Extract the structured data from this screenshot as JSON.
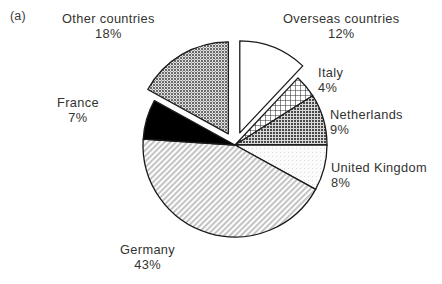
{
  "figure": {
    "panel_label": "(a)",
    "background_color": "#ffffff"
  },
  "chart_data": {
    "type": "pie",
    "title": "",
    "xlabel": "",
    "ylabel": "",
    "legend_position": "none",
    "grid": false,
    "units": "percent",
    "start_angle_deg": 0,
    "direction": "clockwise",
    "categories": [
      "Overseas countries",
      "Italy",
      "Netherlands",
      "United Kingdom",
      "Germany",
      "France",
      "Other countries"
    ],
    "values": [
      12,
      4,
      9,
      8,
      43,
      7,
      18
    ],
    "slices": [
      {
        "name": "Overseas countries",
        "label": "Overseas countries",
        "value": 12,
        "pct_text": "12%",
        "fill_style": "white",
        "fill_color": "#ffffff",
        "stroke_color": "#1a1a1a",
        "exploded": true,
        "start_deg": 0,
        "end_deg": 43.2
      },
      {
        "name": "Italy",
        "label": "Italy",
        "value": 4,
        "pct_text": "4%",
        "fill_style": "crosshatch",
        "fill_color": "#3a3a3a",
        "stroke_color": "#1a1a1a",
        "exploded": false,
        "start_deg": 43.2,
        "end_deg": 57.6
      },
      {
        "name": "Netherlands",
        "label": "Netherlands",
        "value": 9,
        "pct_text": "9%",
        "fill_style": "dark-stipple",
        "fill_color": "#6f6f6f",
        "stroke_color": "#1a1a1a",
        "exploded": false,
        "start_deg": 57.6,
        "end_deg": 90.0
      },
      {
        "name": "United Kingdom",
        "label": "United Kingdom",
        "value": 8,
        "pct_text": "8%",
        "fill_style": "very-light",
        "fill_color": "#efefef",
        "stroke_color": "#1a1a1a",
        "exploded": false,
        "start_deg": 90.0,
        "end_deg": 118.8
      },
      {
        "name": "Germany",
        "label": "Germany",
        "value": 43,
        "pct_text": "43%",
        "fill_style": "light-diagonal-hatch",
        "fill_color": "#c9c9c9",
        "stroke_color": "#1a1a1a",
        "exploded": false,
        "start_deg": 118.8,
        "end_deg": 273.6
      },
      {
        "name": "France",
        "label": "France",
        "value": 7,
        "pct_text": "7%",
        "fill_style": "solid-black",
        "fill_color": "#000000",
        "stroke_color": "#1a1a1a",
        "exploded": false,
        "start_deg": 273.6,
        "end_deg": 298.8
      },
      {
        "name": "Other countries",
        "label": "Other countries",
        "value": 18,
        "pct_text": "18%",
        "fill_style": "medium-stipple",
        "fill_color": "#8a8a8a",
        "stroke_color": "#1a1a1a",
        "exploded": true,
        "start_deg": 298.8,
        "end_deg": 360.0
      }
    ]
  },
  "labels": {
    "other_countries": {
      "name": "Other countries",
      "pct": "18%"
    },
    "overseas_countries": {
      "name": "Overseas countries",
      "pct": "12%"
    },
    "italy": {
      "name": "Italy",
      "pct": "4%"
    },
    "netherlands": {
      "name": "Netherlands",
      "pct": "9%"
    },
    "united_kingdom": {
      "name": "United Kingdom",
      "pct": "8%"
    },
    "germany": {
      "name": "Germany",
      "pct": "43%"
    },
    "france": {
      "name": "France",
      "pct": "7%"
    }
  }
}
